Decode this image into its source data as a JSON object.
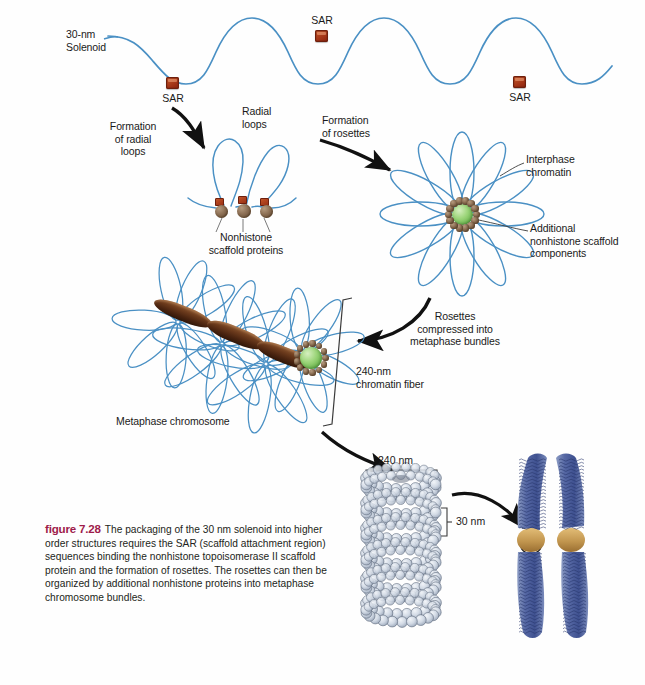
{
  "figure": {
    "number_label": "figure 7.28",
    "caption_text": "The packaging of the 30 nm solenoid into higher order structures requires the SAR (scaffold attachment region) sequences binding the nonhistone topoisomerase II scaffold protein and the formation of rosettes. The rosettes can then be organized by additional nonhistone proteins into metaphase chromosome bundles.",
    "accent_color": "#9e1b4b"
  },
  "colors": {
    "chromatin_blue": "#4a90c4",
    "sar_red": "#a8321a",
    "scaffold_brown": "#8d7055",
    "core_green": "#7fc45c",
    "chromosome_blue": "#5a6fa8",
    "centromere_tan": "#c9a05a",
    "nucleosome_gray": "#ccd5e0"
  },
  "labels": {
    "solenoid": "30-nm\nSolenoid",
    "sar_left": "SAR",
    "sar_top": "SAR",
    "sar_right": "SAR",
    "radial_loops": "Radial\nloops",
    "formation_radial_loops": "Formation\nof radial\nloops",
    "nonhistone_scaffold_proteins": "Nonhistone\nscaffold proteins",
    "formation_of_rosettes": "Formation\nof rosettes",
    "interphase_chromatin": "Interphase\nchromatin",
    "additional_nonhistone": "Additional\nnonhistone scaffold\ncomponents",
    "rosettes_compressed": "Rosettes\ncompressed into\nmetaphase bundles",
    "chromatin_fiber_240": "240-nm\nchromatin fiber",
    "metaphase_chromosome": "Metaphase chromosome",
    "measure_240nm": "240 nm",
    "measure_30nm": "30 nm"
  }
}
